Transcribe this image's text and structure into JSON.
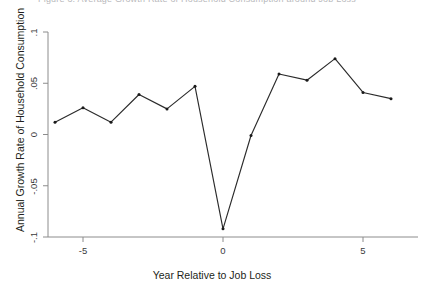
{
  "figure": {
    "clipped_top_text": "Figure 3: Average Growth Rate of Household Consumption around Job Loss",
    "background_color": "#ffffff",
    "line_color": "#2b2b2b",
    "marker_color": "#1a1a1a",
    "axis_color": "#8c8c8c"
  },
  "chart_data": {
    "type": "line",
    "title": "",
    "xlabel": "Year Relative to Job Loss",
    "ylabel": "Annual Growth Rate of Household Consumption",
    "x": [
      -6,
      -5,
      -4,
      -3,
      -2,
      -1,
      0,
      1,
      2,
      3,
      4,
      5,
      6
    ],
    "values": [
      0.012,
      0.026,
      0.012,
      0.039,
      0.025,
      0.047,
      -0.092,
      -0.001,
      0.059,
      0.053,
      0.074,
      0.041,
      0.035
    ],
    "series": [
      {
        "name": "Annual Growth Rate of Household Consumption",
        "values": [
          0.012,
          0.026,
          0.012,
          0.039,
          0.025,
          0.047,
          -0.092,
          -0.001,
          0.059,
          0.053,
          0.074,
          0.041,
          0.035
        ]
      }
    ],
    "xlim": [
      -6.4,
      6.4
    ],
    "ylim": [
      -0.1,
      0.1
    ],
    "xticks": [
      -5,
      0,
      5
    ],
    "xtick_labels": [
      "-5",
      "0",
      "5"
    ],
    "yticks": [
      -0.1,
      -0.05,
      0,
      0.05,
      0.1
    ],
    "ytick_labels": [
      "-.1",
      "-.05",
      "0",
      ".05",
      ".1"
    ],
    "grid": false,
    "legend": "none",
    "markers": "solid-circle"
  }
}
